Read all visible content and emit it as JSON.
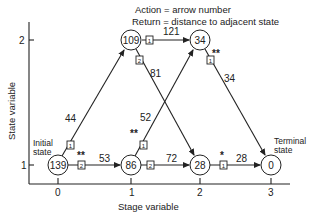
{
  "legend": {
    "line1": "Action = arrow number",
    "line2": "Return = distance to adjacent state"
  },
  "axes": {
    "xlabel": "Stage variable",
    "ylabel": "State variable",
    "x_ticks": [
      "0",
      "1",
      "2",
      "3"
    ],
    "y_ticks": [
      "1",
      "2"
    ]
  },
  "annotations": {
    "initial_line1": "Initial",
    "initial_line2": "state",
    "terminal_line1": "Terminal",
    "terminal_line2": "state"
  },
  "nodes": [
    {
      "id": "s0_1",
      "stage": 0,
      "state": 1,
      "value": "139"
    },
    {
      "id": "s1_1",
      "stage": 1,
      "state": 1,
      "value": "86"
    },
    {
      "id": "s1_2",
      "stage": 1,
      "state": 2,
      "value": "109"
    },
    {
      "id": "s2_1",
      "stage": 2,
      "state": 1,
      "value": "28"
    },
    {
      "id": "s2_2",
      "stage": 2,
      "state": 2,
      "value": "34"
    },
    {
      "id": "s3_1",
      "stage": 3,
      "state": 1,
      "value": "0"
    }
  ],
  "edges": [
    {
      "from": "s0_1",
      "to": "s1_2",
      "action": "1",
      "distance": "44",
      "optimal": ""
    },
    {
      "from": "s0_1",
      "to": "s1_1",
      "action": "2",
      "distance": "53",
      "optimal": "**"
    },
    {
      "from": "s1_2",
      "to": "s2_2",
      "action": "1",
      "distance": "121",
      "optimal": ""
    },
    {
      "from": "s1_2",
      "to": "s2_1",
      "action": "2",
      "distance": "81",
      "optimal": ""
    },
    {
      "from": "s1_1",
      "to": "s2_2",
      "action": "1",
      "distance": "52",
      "optimal": "**"
    },
    {
      "from": "s1_1",
      "to": "s2_1",
      "action": "2",
      "distance": "72",
      "optimal": ""
    },
    {
      "from": "s2_2",
      "to": "s3_1",
      "action": "1",
      "distance": "34",
      "optimal": "**"
    },
    {
      "from": "s2_1",
      "to": "s3_1",
      "action": "1",
      "distance": "28",
      "optimal": "*"
    }
  ]
}
